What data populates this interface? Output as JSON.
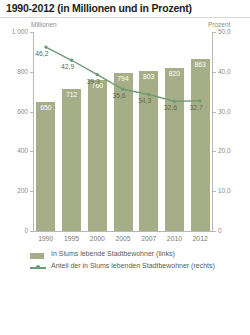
{
  "title": "1990-2012 (in Millionen und in Prozent)",
  "axes": {
    "left_caption": "Millionen",
    "right_caption": "Prozent",
    "left_ticks": [
      "1 000",
      "800",
      "600",
      "400",
      "200",
      "0"
    ],
    "right_ticks": [
      "50,0",
      "40,0",
      "30,0",
      "20,0",
      "10,0",
      "0"
    ]
  },
  "legend": {
    "bar_label": "In Slums lebende Stadtbewohner (links)",
    "line_label": "Anteil der in Slums lebenden Stadtbewohner (rechts)"
  },
  "colors": {
    "bar": "#a6ae88",
    "line": "#6f9b74",
    "axis": "#b9b9b2",
    "title": "#1d1d1b",
    "tick_text": "#8e8e86"
  },
  "chart_data": {
    "type": "bar",
    "title": "1990-2012 (in Millionen und in Prozent)",
    "xlabel": "",
    "ylabel": "Millionen",
    "y2label": "Prozent",
    "ylim": [
      0,
      1000
    ],
    "y2lim": [
      0,
      50
    ],
    "grid": false,
    "legend_position": "bottom-left",
    "categories": [
      "1990",
      "1995",
      "2000",
      "2005",
      "2007",
      "2010",
      "2012"
    ],
    "series": [
      {
        "name": "In Slums lebende Stadtbewohner (links)",
        "type": "bar",
        "axis": "left",
        "unit": "Millionen",
        "values": [
          650,
          712,
          760,
          794,
          803,
          820,
          863
        ],
        "labels": [
          "650",
          "712",
          "760",
          "794",
          "803",
          "820",
          "863"
        ]
      },
      {
        "name": "Anteil der in Slums lebenden Stadtbewohner (rechts)",
        "type": "line",
        "axis": "right",
        "unit": "Prozent",
        "values": [
          46.2,
          42.9,
          39.3,
          35.6,
          34.3,
          32.6,
          32.7
        ],
        "labels": [
          "46,2",
          "42,9",
          "39,3",
          "35,6",
          "34,3",
          "32,6",
          "32,7"
        ]
      }
    ]
  }
}
